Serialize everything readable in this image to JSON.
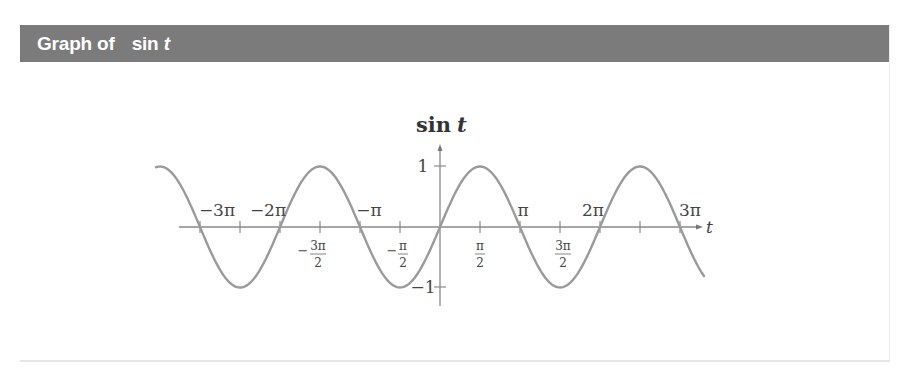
{
  "header": {
    "title_prefix": "Graph of",
    "title_func": "sin",
    "title_var": "t",
    "background": "#7b7b7b",
    "text_color": "#ffffff"
  },
  "chart_data": {
    "type": "line",
    "title": "Graph of sin t",
    "function": "sin(t)",
    "xlabel": "t",
    "ylabel": "sin t",
    "x_range": [
      -3.55,
      3.3
    ],
    "x_range_units": "pi",
    "y_range": [
      -1,
      1
    ],
    "grid": false,
    "legend": null,
    "x_ticks_above": [
      {
        "value": -9.42478,
        "label": "−3π"
      },
      {
        "value": -6.28319,
        "label": "−2π"
      },
      {
        "value": -3.14159,
        "label": "−π"
      },
      {
        "value": 3.14159,
        "label": "π"
      },
      {
        "value": 6.28319,
        "label": "2π"
      },
      {
        "value": 9.42478,
        "label": "3π"
      }
    ],
    "x_ticks_below": [
      {
        "value": -4.71239,
        "label": "−3π/2",
        "sign": "−",
        "num": "3π",
        "den": "2"
      },
      {
        "value": -1.5708,
        "label": "−π/2",
        "sign": "−",
        "num": "π",
        "den": "2"
      },
      {
        "value": 1.5708,
        "label": "π/2",
        "sign": "",
        "num": "π",
        "den": "2"
      },
      {
        "value": 4.71239,
        "label": "3π/2",
        "sign": "",
        "num": "3π",
        "den": "2"
      }
    ],
    "y_ticks": [
      {
        "value": 1,
        "label": "1"
      },
      {
        "value": -1,
        "label": "−1"
      }
    ],
    "key_points": [
      {
        "t": "-3π",
        "y": 0
      },
      {
        "t": "-5π/2",
        "y": -1
      },
      {
        "t": "-2π",
        "y": 0
      },
      {
        "t": "-3π/2",
        "y": 1
      },
      {
        "t": "-π",
        "y": 0
      },
      {
        "t": "-π/2",
        "y": -1
      },
      {
        "t": "0",
        "y": 0
      },
      {
        "t": "π/2",
        "y": 1
      },
      {
        "t": "π",
        "y": 0
      },
      {
        "t": "3π/2",
        "y": -1
      },
      {
        "t": "2π",
        "y": 0
      },
      {
        "t": "5π/2",
        "y": 1
      },
      {
        "t": "3π",
        "y": 0
      }
    ],
    "series": [
      {
        "name": "sin t",
        "color": "#9a9a9a"
      }
    ]
  },
  "labels": {
    "ylabel_func": "sin",
    "ylabel_var": "t",
    "xlabel": "t",
    "x_above": [
      "−3π",
      "−2π",
      "−π",
      "π",
      "2π",
      "3π"
    ],
    "below": [
      {
        "sign": "−",
        "num": "3π",
        "den": "2"
      },
      {
        "sign": "−",
        "num": "π",
        "den": "2"
      },
      {
        "sign": "",
        "num": "π",
        "den": "2"
      },
      {
        "sign": "",
        "num": "3π",
        "den": "2"
      }
    ],
    "y_one": "1",
    "y_neg_one": "−1"
  }
}
